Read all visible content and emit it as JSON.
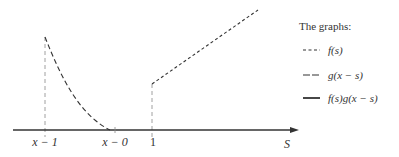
{
  "legend": {
    "title": "The graphs:",
    "items": [
      {
        "style": "short-dash",
        "label": "f(s)"
      },
      {
        "style": "long-dash",
        "label": "g(x − s)"
      },
      {
        "style": "solid",
        "label": "f(s)g(x − s)"
      }
    ]
  },
  "axis": {
    "label": "S",
    "ticks": [
      "x − 1",
      "x − 0",
      "1"
    ]
  },
  "colors": {
    "ink": "#333333",
    "guide": "#888888"
  }
}
